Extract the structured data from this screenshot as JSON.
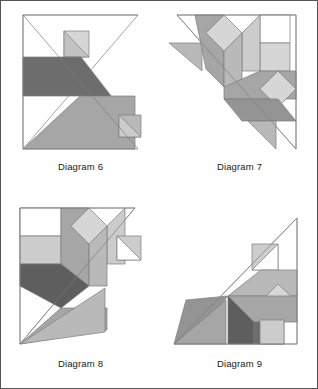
{
  "figure": {
    "kind": "tangram-dissection-figure-set",
    "border_color": "#555555",
    "background_color": "#ffffff",
    "label_color": "#1a1a1a",
    "outline_color": "#7d7d7d"
  },
  "palette": {
    "white": "#ffffff",
    "light": "#d6d6d6",
    "light_alt": "#cccccc",
    "medium_light": "#b9b9b9",
    "medium": "#a6a6a6",
    "medium_dark": "#949494",
    "dark": "#6d6d6d",
    "darker": "#5e5e5e"
  },
  "diagrams": [
    {
      "id": "diagram-6",
      "label": "Diagram 6",
      "shapes": [
        {
          "name": "frame-triangle",
          "fill": "#ffffff",
          "points": "22,14 137,14 22,148"
        },
        {
          "name": "frame-hypotenuse",
          "fill": "none",
          "points": "22,14 137,148"
        },
        {
          "name": "small-square-top",
          "fill": "#d6d6d6",
          "points": "63,30 88,30 88,56 63,56"
        },
        {
          "name": "small-triangle-top",
          "fill": "#cccccc",
          "points": "63,30 88,56 63,56"
        },
        {
          "name": "dark-parallelogram",
          "fill": "#6d6d6d",
          "points": "22,56 79,56 137,132 113,148 22,148 79,95 22,56"
        },
        {
          "name": "dark-band",
          "fill": "#6d6d6d",
          "points": "22,56 80,56 138,131 114,148 79,95"
        },
        {
          "name": "large-light-quad",
          "fill": "#a6a6a6",
          "points": "22,148 79,95 134,95 134,148"
        },
        {
          "name": "lower-square",
          "fill": "#b9b9b9",
          "points": "118,114 140,114 140,136 118,136"
        },
        {
          "name": "lower-triangle",
          "fill": "#cccccc",
          "points": "118,114 140,136 118,136"
        },
        {
          "name": "base-line",
          "fill": "none",
          "points": "22,148 137,148"
        }
      ]
    },
    {
      "id": "diagram-7",
      "label": "Diagram 7",
      "shapes": [
        {
          "name": "frame-triangle",
          "fill": "#ffffff",
          "points": "17,14 136,14 136,148"
        },
        {
          "name": "frame-hypotenuse",
          "fill": "none",
          "points": "17,14 136,148"
        },
        {
          "name": "left-small-triangle",
          "fill": "#b9b9b9",
          "points": "9,42 42,42 42,70"
        },
        {
          "name": "center-stem-left",
          "fill": "#a6a6a6",
          "points": "35,14 64,14 64,86 48,86"
        },
        {
          "name": "center-diamond",
          "fill": "#d6d6d6",
          "points": "64,14 82,32 64,50 46,32"
        },
        {
          "name": "center-petal-right",
          "fill": "#cccccc",
          "points": "82,32 100,14 100,70 82,70"
        },
        {
          "name": "center-stem-right",
          "fill": "#b9b9b9",
          "points": "64,50 82,32 82,86 64,86"
        },
        {
          "name": "upper-right-square",
          "fill": "#d6d6d6",
          "points": "100,42 130,42 130,70 100,70"
        },
        {
          "name": "upper-right-tri",
          "fill": "#ffffff",
          "points": "100,14 130,14 130,42 100,42"
        },
        {
          "name": "mid-band",
          "fill": "#a6a6a6",
          "points": "64,86 100,70 136,70 136,98 64,98"
        },
        {
          "name": "lower-parallelogram",
          "fill": "#949494",
          "points": "64,98 118,98 136,120 82,120"
        },
        {
          "name": "right-diamond",
          "fill": "#d6d6d6",
          "points": "118,70 136,88 118,106 100,88"
        },
        {
          "name": "bottom-small-tri",
          "fill": "#b9b9b9",
          "points": "88,120 116,120 116,148"
        },
        {
          "name": "right-edge",
          "fill": "none",
          "points": "136,14 136,148"
        }
      ]
    },
    {
      "id": "diagram-8",
      "label": "Diagram 8",
      "shapes": [
        {
          "name": "frame-triangle",
          "fill": "#ffffff",
          "points": "19,12 134,12 19,148"
        },
        {
          "name": "frame-hypotenuse",
          "fill": "none",
          "points": "134,12 19,148"
        },
        {
          "name": "upper-left-white",
          "fill": "#ffffff",
          "points": "19,12 60,12 60,40 19,40"
        },
        {
          "name": "left-light-band",
          "fill": "#cccccc",
          "points": "19,40 60,40 60,68 19,68"
        },
        {
          "name": "center-stem-left",
          "fill": "#a6a6a6",
          "points": "60,12 88,12 88,90 60,68"
        },
        {
          "name": "center-diamond",
          "fill": "#d6d6d6",
          "points": "88,12 106,30 88,48 70,30"
        },
        {
          "name": "center-petal-right",
          "fill": "#cccccc",
          "points": "106,30 124,12 124,68 106,68"
        },
        {
          "name": "center-stem-right",
          "fill": "#b9b9b9",
          "points": "88,48 106,30 106,90 88,90"
        },
        {
          "name": "dark-chevron",
          "fill": "#5e5e5e",
          "points": "19,68 60,68 88,90 60,112 19,90"
        },
        {
          "name": "dark-band-right",
          "fill": "#6d6d6d",
          "points": "60,68 88,90 60,112"
        },
        {
          "name": "large-gray-wedge",
          "fill": "#a6a6a6",
          "points": "19,148 60,112 106,112 106,134"
        },
        {
          "name": "gray-spike",
          "fill": "#b9b9b9",
          "points": "19,148 104,90 104,136"
        },
        {
          "name": "right-small-square",
          "fill": "#cccccc",
          "points": "116,40 140,40 140,64 116,64"
        },
        {
          "name": "right-small-tri",
          "fill": "#ffffff",
          "points": "116,40 140,64 116,64"
        },
        {
          "name": "left-edge",
          "fill": "none",
          "points": "19,12 19,148"
        }
      ]
    },
    {
      "id": "diagram-9",
      "label": "Diagram 9",
      "shapes": [
        {
          "name": "frame-triangle",
          "fill": "#ffffff",
          "points": "14,148 137,148 137,22"
        },
        {
          "name": "frame-hypotenuse",
          "fill": "none",
          "points": "14,148 137,22"
        },
        {
          "name": "top-small-square",
          "fill": "#cccccc",
          "points": "92,48 118,48 118,74 92,74"
        },
        {
          "name": "top-small-tri",
          "fill": "#ffffff",
          "points": "118,48 118,74 92,74"
        },
        {
          "name": "upper-light-band",
          "fill": "#b9b9b9",
          "points": "68,100 101,74 137,74 137,100"
        },
        {
          "name": "right-diamond",
          "fill": "#d6d6d6",
          "points": "118,88 137,106 118,124 100,106"
        },
        {
          "name": "mid-gray-band",
          "fill": "#a6a6a6",
          "points": "68,100 137,100 137,126 94,126"
        },
        {
          "name": "dark-block",
          "fill": "#5e5e5e",
          "points": "68,100 94,126 94,148 68,148"
        },
        {
          "name": "dark-block-right",
          "fill": "#6d6d6d",
          "points": "94,126 124,126 124,148 94,148"
        },
        {
          "name": "left-gray-wing",
          "fill": "#949494",
          "points": "14,148 26,104 68,100 38,134"
        },
        {
          "name": "left-gray-wing-low",
          "fill": "#a6a6a6",
          "points": "14,148 66,104 66,148"
        },
        {
          "name": "lower-right-square",
          "fill": "#cccccc",
          "points": "100,124 124,124 124,148 100,148"
        },
        {
          "name": "right-edge",
          "fill": "none",
          "points": "137,22 137,148"
        },
        {
          "name": "base-line",
          "fill": "none",
          "points": "14,148 137,148"
        }
      ]
    }
  ]
}
